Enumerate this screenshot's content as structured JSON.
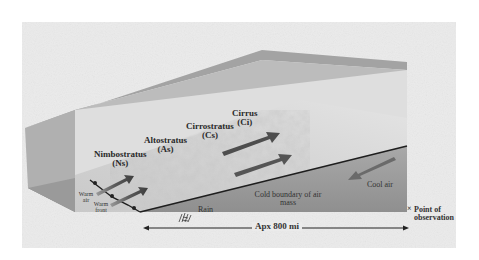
{
  "diagram": {
    "type": "warm-front cross-section",
    "clouds": [
      {
        "name": "Cirrus",
        "abbr": "(Ci)"
      },
      {
        "name": "Cirrostratus",
        "abbr": "(Cs)"
      },
      {
        "name": "Altostratus",
        "abbr": "(As)"
      },
      {
        "name": "Nimbostratus",
        "abbr": "(Ns)"
      }
    ],
    "labels": {
      "warm_air": "Warm air",
      "warm_front": "Warm front",
      "rain": "Rain",
      "cold_boundary": "Cold boundary of air mass",
      "cool_air": "Cool air",
      "point_of_observation": "Point of observation",
      "distance": "Apx 800 mi"
    },
    "colors": {
      "background": "#ebebeb",
      "top_wedge": "#9a9a9a",
      "side_face": "#b8b8b8",
      "floor": "#8c8c8c",
      "back_wall": "#e2e2e2",
      "arrow_dark": "#4a4a4a",
      "boundary_line": "#1e1e1e"
    }
  }
}
